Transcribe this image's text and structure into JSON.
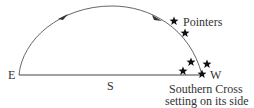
{
  "diagram": {
    "labels": {
      "east": "E",
      "west": "W",
      "south": "S",
      "pointers": "Pointers",
      "caption_line1": "Southern Cross",
      "caption_line2": "setting on its side"
    },
    "colors": {
      "line": "#444444",
      "text": "#333333",
      "star": "#111111"
    },
    "stars": [
      {
        "name": "pointer-star-1",
        "x": 174,
        "y": 21
      },
      {
        "name": "pointer-star-2",
        "x": 185,
        "y": 33
      },
      {
        "name": "cross-star-top",
        "x": 191,
        "y": 62
      },
      {
        "name": "cross-star-right",
        "x": 207,
        "y": 64
      },
      {
        "name": "cross-star-left",
        "x": 183,
        "y": 71
      },
      {
        "name": "cross-star-bottom",
        "x": 202,
        "y": 74
      }
    ]
  }
}
